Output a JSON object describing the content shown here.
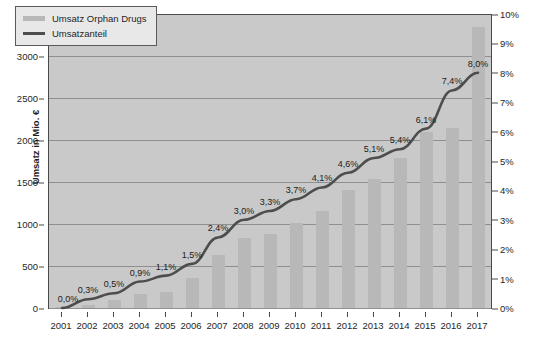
{
  "chart_data": {
    "type": "bar",
    "title": "",
    "subtitle": "",
    "xlabel": "",
    "ylabel": "Umsatz in Mio. €",
    "y2label": "Umsatzanteil in %",
    "categories": [
      "2001",
      "2002",
      "2003",
      "2004",
      "2005",
      "2006",
      "2007",
      "2008",
      "2009",
      "2010",
      "2011",
      "2012",
      "2013",
      "2014",
      "2015",
      "2016",
      "2017"
    ],
    "ylim": [
      0,
      3500
    ],
    "y2lim": [
      0,
      10
    ],
    "yticks": [
      "0",
      "500",
      "1000",
      "1500",
      "2000",
      "2500",
      "3000",
      "3500"
    ],
    "ytick_values": [
      0,
      500,
      1000,
      1500,
      2000,
      2500,
      3000,
      3500
    ],
    "y2ticks": [
      "0%",
      "1%",
      "2%",
      "3%",
      "4%",
      "5%",
      "6%",
      "7%",
      "8%",
      "9%",
      "10%"
    ],
    "y2tick_values": [
      0,
      1,
      2,
      3,
      4,
      5,
      6,
      7,
      8,
      9,
      10
    ],
    "grid": true,
    "legend_position": "top-left",
    "series": [
      {
        "name": "Umsatz Orphan Drugs",
        "type": "bar",
        "axis": "left",
        "unit": "Mio. €",
        "color": "#b8b8b8",
        "values": [
          10,
          40,
          90,
          170,
          190,
          360,
          630,
          830,
          880,
          1010,
          1160,
          1400,
          1540,
          1790,
          2090,
          2140,
          3350
        ]
      },
      {
        "name": "Umsatzanteil",
        "type": "line",
        "axis": "right",
        "unit": "%",
        "color": "#4d4d4d",
        "values": [
          0.0,
          0.3,
          0.5,
          0.9,
          1.1,
          1.5,
          2.4,
          3.0,
          3.3,
          3.7,
          4.1,
          4.6,
          5.1,
          5.4,
          6.1,
          7.4,
          8.0
        ],
        "data_labels": [
          "0,0%",
          "0,3%",
          "0,5%",
          "0,9%",
          "1,1%",
          "1,5%",
          "2,4%",
          "3,0%",
          "3,3%",
          "3,7%",
          "4,1%",
          "4,6%",
          "5,1%",
          "5,4%",
          "6,1%",
          "7,4%",
          "8,0%"
        ]
      }
    ]
  },
  "legend": {
    "items": [
      {
        "label": "Umsatz Orphan Drugs",
        "marker": "bar-swatch"
      },
      {
        "label": "Umsatzanteil",
        "marker": "line-swatch"
      }
    ]
  },
  "colors": {
    "plot_background": "#c9c9c9",
    "bar": "#b8b8b8",
    "line": "#4d4d4d",
    "gridline": "#8f8f8f",
    "axis": "#4a4a4a",
    "text": "#1f1f1f",
    "legend_background": "#e8e8e8"
  }
}
